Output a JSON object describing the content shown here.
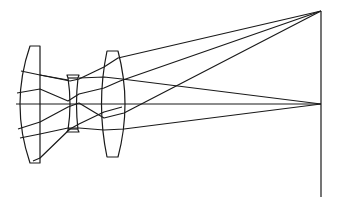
{
  "colors": {
    "line": "#1a1a1a",
    "background": "#ffffff"
  },
  "elements": {
    "lens1": "plano-convex lens (left)",
    "lens2": "biconcave lens (middle)",
    "lens3": "biconvex lens (right)",
    "image_plane": "image plane"
  },
  "rays": {
    "off_axis_focus": [
      321,
      11
    ],
    "on_axis_focus": [
      321,
      104
    ],
    "optical_axis_y": 104
  }
}
